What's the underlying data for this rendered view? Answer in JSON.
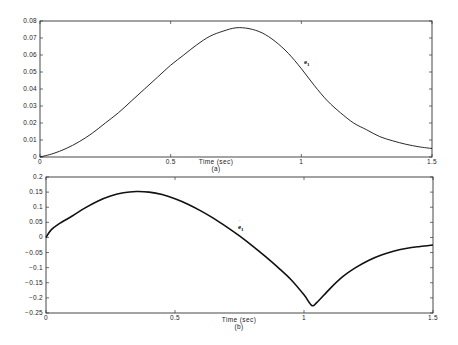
{
  "chart_data": [
    {
      "type": "line",
      "panel": "a",
      "title": "",
      "xlabel": "Time (sec)",
      "caption": "(a)",
      "ylabel": "",
      "xlim": [
        0,
        1.5
      ],
      "ylim": [
        0,
        0.08
      ],
      "xticks": [
        "0",
        "0.5",
        "1",
        "1.5"
      ],
      "yticks": [
        "0",
        "0.01",
        "0.02",
        "0.03",
        "0.04",
        "0.05",
        "0.06",
        "0.07",
        "0.08"
      ],
      "grid": false,
      "annotation": "e1",
      "series": [
        {
          "name": "e1",
          "x": [
            0,
            0.05,
            0.1,
            0.15,
            0.2,
            0.25,
            0.3,
            0.35,
            0.4,
            0.45,
            0.5,
            0.55,
            0.6,
            0.65,
            0.7,
            0.75,
            0.8,
            0.85,
            0.9,
            0.95,
            1.0,
            1.05,
            1.1,
            1.15,
            1.2,
            1.25,
            1.3,
            1.35,
            1.4,
            1.45,
            1.5
          ],
          "values": [
            0,
            0.002,
            0.005,
            0.009,
            0.014,
            0.02,
            0.026,
            0.033,
            0.04,
            0.047,
            0.054,
            0.06,
            0.066,
            0.071,
            0.074,
            0.076,
            0.0755,
            0.073,
            0.068,
            0.061,
            0.052,
            0.042,
            0.033,
            0.026,
            0.02,
            0.016,
            0.012,
            0.0095,
            0.0075,
            0.006,
            0.005
          ]
        }
      ]
    },
    {
      "type": "line",
      "panel": "b",
      "title": "",
      "xlabel": "Time (sec)",
      "caption": "(b)",
      "ylabel": "",
      "xlim": [
        0,
        1.5
      ],
      "ylim": [
        -0.25,
        0.2
      ],
      "xticks": [
        "0",
        "0.5",
        "1",
        "1.5"
      ],
      "yticks": [
        "-0.25",
        "-0.2",
        "-0.15",
        "-0.1",
        "-0.05",
        "0",
        "0.05",
        "0.1",
        "0.15",
        "0.2"
      ],
      "grid": false,
      "annotation": "ė1",
      "series": [
        {
          "name": "e1_dot",
          "x": [
            0,
            0.02,
            0.05,
            0.1,
            0.15,
            0.2,
            0.25,
            0.3,
            0.35,
            0.4,
            0.45,
            0.5,
            0.55,
            0.6,
            0.65,
            0.7,
            0.75,
            0.8,
            0.85,
            0.9,
            0.95,
            1.0,
            1.03,
            1.05,
            1.1,
            1.15,
            1.2,
            1.25,
            1.3,
            1.35,
            1.4,
            1.45,
            1.5
          ],
          "values": [
            0,
            0.025,
            0.045,
            0.07,
            0.097,
            0.12,
            0.137,
            0.148,
            0.152,
            0.15,
            0.142,
            0.128,
            0.11,
            0.088,
            0.063,
            0.035,
            0.005,
            -0.028,
            -0.063,
            -0.1,
            -0.14,
            -0.19,
            -0.225,
            -0.215,
            -0.17,
            -0.13,
            -0.1,
            -0.076,
            -0.058,
            -0.045,
            -0.036,
            -0.03,
            -0.025
          ]
        }
      ]
    }
  ],
  "panels": {
    "a": {
      "xlabel": "Time (sec)",
      "caption": "(a)",
      "annotation_main": "e",
      "annotation_sub": "1",
      "xticks": [
        "0",
        "0.5",
        "1",
        "1.5"
      ],
      "yticks": [
        "0",
        "0.01",
        "0.02",
        "0.03",
        "0.04",
        "0.05",
        "0.06",
        "0.07",
        "0.08"
      ]
    },
    "b": {
      "xlabel": "Time (sec)",
      "caption": "(b)",
      "annotation_main": "e",
      "annotation_dot": "·",
      "annotation_sub": "1",
      "xticks": [
        "0",
        "0.5",
        "1",
        "1.5"
      ],
      "yticks": [
        "-0.25",
        "-0.2",
        "-0.15",
        "-0.1",
        "-0.05",
        "0",
        "0.05",
        "0.1",
        "0.15",
        "0.2"
      ]
    }
  },
  "colors": {
    "line": "#111111",
    "frame": "#333333",
    "text": "#222222",
    "background": "#ffffff"
  }
}
